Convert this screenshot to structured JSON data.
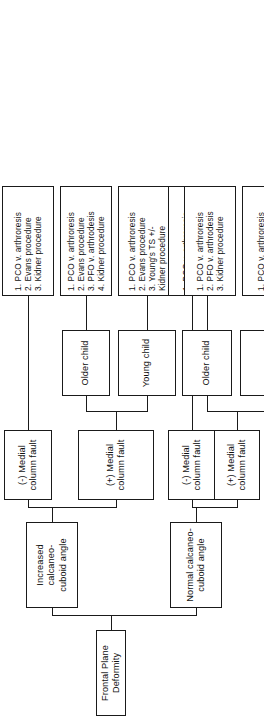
{
  "diagram": {
    "orientation": "rotated-90",
    "root": {
      "label": "Frontal Plane Deformity"
    },
    "branches": [
      {
        "id": "increased",
        "label": "Increased calcaneo-\ncuboid angle",
        "children": [
          {
            "id": "inc-neg-mcf",
            "label": "(-) Medial\ncolumn fault",
            "treatments": "1. PCO v. arthroresis\n2. Evans procedure\n3. Kidner procedure"
          },
          {
            "id": "inc-pos-mcf",
            "label": "(+) Medial\ncolumn fault",
            "ages": [
              {
                "id": "inc-pos-older",
                "label": "Older child",
                "treatments": "1. PCO v. arthroresis\n2. Evans procedure\n3. PFO v. arthrodesis\n4. Kidner procedure"
              },
              {
                "id": "inc-pos-young",
                "label": "Young child",
                "treatments": "1. PCO v. arthroresis\n2. Evans procedure\n3. Young's TS +/-\nKidner procedure"
              }
            ]
          }
        ]
      },
      {
        "id": "normal",
        "label": "Normal calcaneo-\ncuboid angle",
        "children": [
          {
            "id": "nrm-neg-mcf",
            "label": "(-) Medial\ncolumn fault",
            "treatments": "1. PCO v. arthroresis\n2. Kidner procedure"
          },
          {
            "id": "nrm-pos-mcf",
            "label": "(+) Medial\ncolumn fault",
            "ages": [
              {
                "id": "nrm-pos-older",
                "label": "Older child",
                "treatments": "1. PCO v. arthroresis\n2. PFO v. arthrodesis\n3. Kidner procedure"
              },
              {
                "id": "nrm-pos-young",
                "label": "Young child",
                "treatments": "1. PCO v. arthroresis\n2. Young's TS +/-\nKidner procedure"
              }
            ]
          }
        ]
      }
    ],
    "colors": {
      "stroke": "#1a1a1a",
      "background": "#ffffff",
      "text": "#111111"
    }
  }
}
